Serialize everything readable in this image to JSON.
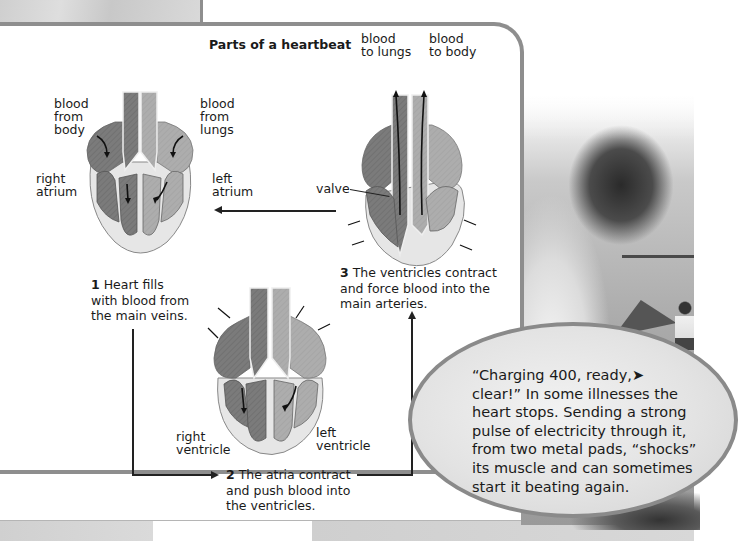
{
  "diagram": {
    "title": "Parts of a heartbeat",
    "stage1": {
      "number": "1",
      "caption_lines": [
        "Heart fills",
        "with blood from",
        "the main veins."
      ],
      "labels": {
        "blood_from_body": [
          "blood",
          "from",
          "body"
        ],
        "blood_from_lungs": [
          "blood",
          "from",
          "lungs"
        ],
        "right_atrium": [
          "right",
          "atrium"
        ],
        "left_atrium": [
          "left",
          "atrium"
        ]
      }
    },
    "stage2": {
      "number": "2",
      "caption_lines": [
        "The atria contract",
        "and push blood into",
        "the ventricles."
      ],
      "labels": {
        "right_ventricle": [
          "right",
          "ventricle"
        ],
        "left_ventricle": [
          "left",
          "ventricle"
        ]
      }
    },
    "stage3": {
      "number": "3",
      "caption_lines": [
        "The ventricles contract",
        "and force blood into the",
        "main arteries."
      ],
      "labels": {
        "blood_to_lungs": [
          "blood",
          "to lungs"
        ],
        "blood_to_body": [
          "blood",
          "to body"
        ],
        "valve": "valve"
      }
    }
  },
  "callout": {
    "lines": [
      "“Charging 400, ready,➤",
      "clear!” In some illnesses the",
      "heart stops. Sending a strong",
      "pulse of electricity through it,",
      "from two metal pads, “shocks”",
      "its muscle and can sometimes",
      "start it beating again."
    ]
  },
  "colors": {
    "panel_border": "#8e8e8e",
    "right_side_dark": "#7a7a7a",
    "left_side_light": "#a9a9a9",
    "heart_wall": "#e4e4e4"
  }
}
